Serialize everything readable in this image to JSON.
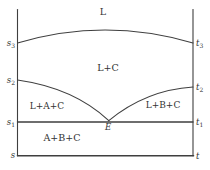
{
  "diagram": {
    "type": "eutectic-phase-diagram-section",
    "regions": {
      "liquid": {
        "label": "L"
      },
      "liquid_c": {
        "label": "L+C"
      },
      "liquid_a_c": {
        "label": "L+A+C"
      },
      "liquid_b_c": {
        "label": "L+B+C"
      },
      "a_b_c": {
        "label": "A+B+C"
      }
    },
    "points": {
      "s3": {
        "base": "s",
        "sub": "3"
      },
      "s2": {
        "base": "s",
        "sub": "2"
      },
      "s1": {
        "base": "s",
        "sub": "1"
      },
      "s": {
        "base": "s",
        "sub": ""
      },
      "t3": {
        "base": "t",
        "sub": "3"
      },
      "t2": {
        "base": "t",
        "sub": "2"
      },
      "t1": {
        "base": "t",
        "sub": "1"
      },
      "t": {
        "base": "t",
        "sub": ""
      },
      "eutectic": {
        "base": "E",
        "sub": ""
      }
    },
    "colors": {
      "line": "#3f3f3f",
      "text": "#333333",
      "background": "#ffffff"
    }
  }
}
